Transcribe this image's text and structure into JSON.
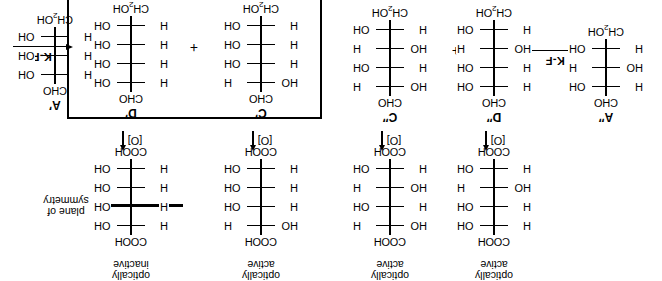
{
  "figure": {
    "orientation": "rotated-180",
    "reagent_label_left": "K-F",
    "reagent_label_right": "K-F",
    "oxidation_label": "[O]",
    "plus_sign": "+",
    "symmetry_label_line1": "plane of",
    "symmetry_label_line2": "symmetry",
    "optically_active": "optically\nactive",
    "colors": {
      "ink": "#000000",
      "paper": "#ffffff"
    }
  },
  "left_panel": {
    "starting_material": {
      "name": "A″",
      "top": "CHO",
      "bottom": "CH₂OH",
      "rows": [
        {
          "left": "H",
          "right": "OH"
        },
        {
          "left": "HO",
          "right": "H"
        },
        {
          "left": "H",
          "right": "OH"
        }
      ]
    },
    "products": [
      {
        "name": "D″",
        "top": "CHO",
        "bottom": "CH₂OH",
        "rows": [
          {
            "left": "H",
            "right": "OH"
          },
          {
            "left": "H",
            "right": "OH"
          },
          {
            "left": "HO",
            "right": "H"
          },
          {
            "left": "H",
            "right": "OH"
          }
        ],
        "oxidized": {
          "top": "COOH",
          "bottom": "COOH",
          "status_line1": "optically",
          "status_line2": "active",
          "rows": [
            {
              "left": "H",
              "right": "OH"
            },
            {
              "left": "H",
              "right": "OH"
            },
            {
              "left": "HO",
              "right": "H"
            },
            {
              "left": "H",
              "right": "OH"
            }
          ]
        }
      },
      {
        "name": "C″",
        "top": "CHO",
        "bottom": "CH₂OH",
        "rows": [
          {
            "left": "HO",
            "right": "H"
          },
          {
            "left": "H",
            "right": "OH"
          },
          {
            "left": "HO",
            "right": "H"
          },
          {
            "left": "H",
            "right": "OH"
          }
        ],
        "oxidized": {
          "top": "COOH",
          "bottom": "COOH",
          "status_line1": "optically",
          "status_line2": "active",
          "rows": [
            {
              "left": "HO",
              "right": "H"
            },
            {
              "left": "H",
              "right": "OH"
            },
            {
              "left": "HO",
              "right": "H"
            },
            {
              "left": "H",
              "right": "OH"
            }
          ]
        }
      }
    ]
  },
  "right_panel": {
    "starting_material": {
      "name": "A′",
      "top": "CHO",
      "bottom": "CH₂OH",
      "rows": [
        {
          "left": "H",
          "right": "OH"
        },
        {
          "left": "H",
          "right": "OH"
        },
        {
          "left": "H",
          "right": "OH"
        }
      ]
    },
    "boxed": true,
    "products": [
      {
        "name": "D′",
        "top": "CHO",
        "bottom": "CH₂OH",
        "rows": [
          {
            "left": "H",
            "right": "OH"
          },
          {
            "left": "H",
            "right": "OH"
          },
          {
            "left": "H",
            "right": "OH"
          },
          {
            "left": "H",
            "right": "OH"
          }
        ],
        "oxidized": {
          "top": "COOH",
          "bottom": "COOH",
          "status_line1": "optically",
          "status_line2": "inactive",
          "has_plane_of_symmetry": true,
          "rows": [
            {
              "left": "H",
              "right": "OH"
            },
            {
              "left": "H",
              "right": "OH"
            },
            {
              "left": "H",
              "right": "OH"
            },
            {
              "left": "H",
              "right": "OH"
            }
          ]
        }
      },
      {
        "name": "C′",
        "top": "CHO",
        "bottom": "CH₂OH",
        "rows": [
          {
            "left": "HO",
            "right": "H"
          },
          {
            "left": "H",
            "right": "OH"
          },
          {
            "left": "H",
            "right": "OH"
          },
          {
            "left": "H",
            "right": "OH"
          }
        ],
        "oxidized": {
          "top": "COOH",
          "bottom": "COOH",
          "status_line1": "optically",
          "status_line2": "active",
          "rows": [
            {
              "left": "HO",
              "right": "H"
            },
            {
              "left": "H",
              "right": "OH"
            },
            {
              "left": "H",
              "right": "OH"
            },
            {
              "left": "H",
              "right": "OH"
            }
          ]
        }
      }
    ]
  }
}
